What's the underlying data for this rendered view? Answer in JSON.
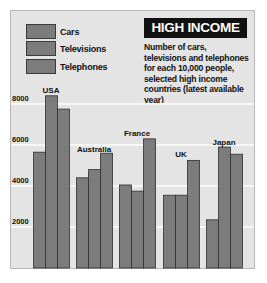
{
  "chart_data": {
    "type": "bar",
    "title": "HIGH INCOME",
    "subtitle": "Number of cars, televisions and telephones for each 10,000 people, selected high income countries (latest available year)",
    "xlabel": "",
    "ylabel": "",
    "categories": [
      "USA",
      "Australia",
      "France",
      "UK",
      "Japan"
    ],
    "series": [
      {
        "name": "Cars",
        "values": [
          5650,
          4400,
          4050,
          3550,
          2350
        ]
      },
      {
        "name": "Televisions",
        "values": [
          8400,
          4800,
          3750,
          3550,
          5900
        ]
      },
      {
        "name": "Telephones",
        "values": [
          7750,
          5600,
          6300,
          5250,
          5550
        ]
      }
    ],
    "ylim": [
      0,
      9000
    ],
    "yticks": [
      2000,
      4000,
      6000,
      8000
    ],
    "ytick_labels": [
      "2000",
      "4000",
      "6000",
      "8000"
    ],
    "grid": true,
    "legend_position": "top-left",
    "colors": {
      "bar": "#7c7c7c",
      "bar_outline": "#2e2e2e",
      "background": "#e4e4e4",
      "gridline": "#f7f7f7",
      "title_bg": "#111111",
      "title_fg": "#ffffff"
    }
  }
}
